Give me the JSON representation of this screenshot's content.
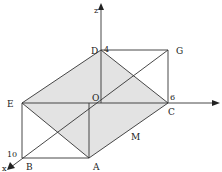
{
  "diagram": {
    "type": "3d-cuboid-with-axes",
    "shaded_plane_color": "#e3e3e3",
    "line_color": "#333333",
    "axes": {
      "z": {
        "label": "z"
      },
      "y": {
        "label": ""
      },
      "x": {
        "label": "x"
      }
    },
    "vertices": {
      "O": {
        "label": "O"
      },
      "A": {
        "label": "A"
      },
      "B": {
        "label": "B"
      },
      "C": {
        "label": "C"
      },
      "D": {
        "label": "D"
      },
      "E": {
        "label": "E"
      },
      "G": {
        "label": "G"
      },
      "M": {
        "label": "M"
      }
    },
    "axis_values": {
      "z_value": "4",
      "y_value": "6",
      "x_value": "10"
    },
    "shaded_plane": [
      "D",
      "E",
      "A",
      "C"
    ]
  }
}
